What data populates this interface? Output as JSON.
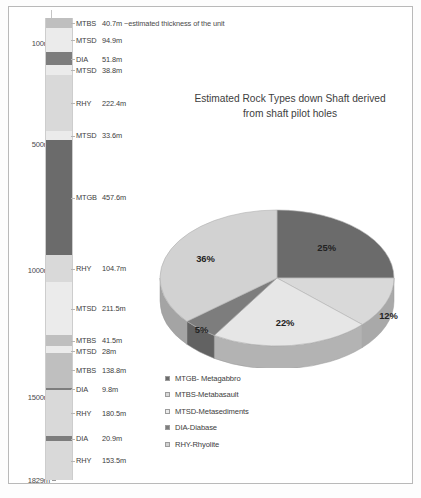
{
  "document": {
    "background_color": "#ffffff",
    "border_color": "#b9b9b9"
  },
  "colors": {
    "MTGB": "#6b6b6b",
    "MTBS": "#bfbfbf",
    "MTSD": "#ebebeb",
    "DIA": "#7d7d7d",
    "RHY": "#d9d9d9"
  },
  "strat_column": {
    "total_depth_label": "1829m",
    "total_depth_m": 1829,
    "depth_ticks": [
      {
        "label": "100m",
        "depth": 100
      },
      {
        "label": "500m",
        "depth": 500
      },
      {
        "label": "1000m",
        "depth": 1000
      },
      {
        "label": "1500m",
        "depth": 1500
      },
      {
        "label": "1829m",
        "depth": 1829
      }
    ],
    "note": "~estimated thickness of the unit",
    "units": [
      {
        "code": "MTBS",
        "thickness": "40.7m",
        "value": 40.7,
        "rock": "MTBS"
      },
      {
        "code": "MTSD",
        "thickness": "94.9m",
        "value": 94.9,
        "rock": "MTSD"
      },
      {
        "code": "DIA",
        "thickness": "51.8m",
        "value": 51.8,
        "rock": "DIA"
      },
      {
        "code": "MTSD",
        "thickness": "38.8m",
        "value": 38.8,
        "rock": "MTSD"
      },
      {
        "code": "RHY",
        "thickness": "222.4m",
        "value": 222.4,
        "rock": "RHY"
      },
      {
        "code": "MTSD",
        "thickness": "33.6m",
        "value": 33.6,
        "rock": "MTSD"
      },
      {
        "code": "MTGB",
        "thickness": "457.6m",
        "value": 457.6,
        "rock": "MTGB"
      },
      {
        "code": "RHY",
        "thickness": "104.7m",
        "value": 104.7,
        "rock": "RHY"
      },
      {
        "code": "MTSD",
        "thickness": "211.5m",
        "value": 211.5,
        "rock": "MTSD"
      },
      {
        "code": "MTBS",
        "thickness": "41.5m",
        "value": 41.5,
        "rock": "MTBS"
      },
      {
        "code": "MTSD",
        "thickness": "28m",
        "value": 28,
        "rock": "MTSD"
      },
      {
        "code": "MTBS",
        "thickness": "138.8m",
        "value": 138.8,
        "rock": "MTBS"
      },
      {
        "code": "DIA",
        "thickness": "9.8m",
        "value": 9.8,
        "rock": "DIA"
      },
      {
        "code": "RHY",
        "thickness": "180.5m",
        "value": 180.5,
        "rock": "RHY"
      },
      {
        "code": "DIA",
        "thickness": "20.9m",
        "value": 20.9,
        "rock": "DIA"
      },
      {
        "code": "RHY",
        "thickness": "153.5m",
        "value": 153.5,
        "rock": "RHY"
      }
    ]
  },
  "chart_data": {
    "type": "pie",
    "title": "Estimated Rock Types down Shaft derived from  shaft pilot holes",
    "title_line1": "Estimated Rock Types down Shaft derived",
    "title_line2": "from  shaft pilot holes",
    "categories": [
      "MTGB- Metagabbro",
      "MTBS-Metabasalt",
      "MTSD-Metasediments",
      "DIA-Diabase",
      "RHY-Rhyolite"
    ],
    "values": [
      25,
      12,
      22,
      5,
      36
    ],
    "labels": [
      "25%",
      "12%",
      "22%",
      "5%",
      "36%"
    ],
    "slice_colors": [
      "#6b6b6b",
      "#d9d9d9",
      "#e6e6e6",
      "#7d7d7d",
      "#d2d2d2"
    ],
    "legend_position": "bottom-left",
    "three_d": true,
    "legend": [
      {
        "label": "MTGB- Metagabbro",
        "color": "#6b6b6b"
      },
      {
        "label": "MTBS-Metabasault",
        "color": "#d9d9d9"
      },
      {
        "label": "MTSD-Metasediments",
        "color": "#ececec"
      },
      {
        "label": "DIA-Diabase",
        "color": "#7d7d7d"
      },
      {
        "label": "RHY-Rhyolite",
        "color": "#d2d2d2"
      }
    ]
  }
}
